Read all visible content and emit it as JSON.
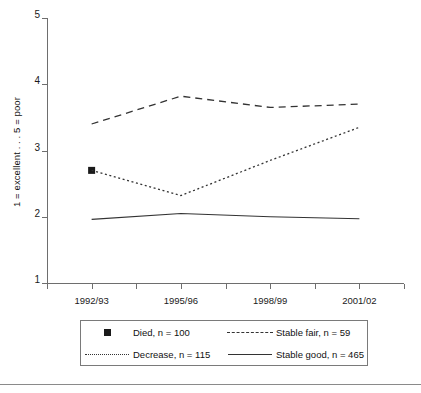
{
  "chart_data": {
    "type": "line",
    "title": "",
    "xlabel": "",
    "ylabel": "1 = excellent . . . 5 = poor",
    "categories": [
      "1992/93",
      "1995/96",
      "1998/99",
      "2001/02"
    ],
    "x_positions": [
      1,
      3,
      5,
      7
    ],
    "xlim": [
      0,
      8
    ],
    "ylim": [
      1,
      5
    ],
    "yticks": [
      "1",
      "2",
      "3",
      "4",
      "5"
    ],
    "ytick_values": [
      1,
      2,
      3,
      4,
      5
    ],
    "grid": false,
    "legend_position": "below",
    "series": [
      {
        "name": "Died, n = 100",
        "short_name": "Died",
        "n": 100,
        "style": "marker",
        "marker": "filled-square",
        "color": "#1a1a1a",
        "x": [
          1
        ],
        "values": [
          2.7
        ]
      },
      {
        "name": "Stable fair, n = 59",
        "short_name": "Stable fair",
        "n": 59,
        "style": "dashed",
        "color": "#333333",
        "x": [
          1,
          3,
          5,
          7
        ],
        "values": [
          3.4,
          3.82,
          3.65,
          3.7
        ]
      },
      {
        "name": "Decrease, n = 115",
        "short_name": "Decrease",
        "n": 115,
        "style": "dotted",
        "color": "#333333",
        "x": [
          1,
          3,
          5,
          7
        ],
        "values": [
          2.7,
          2.32,
          2.85,
          3.35
        ]
      },
      {
        "name": "Stable good, n = 465",
        "short_name": "Stable good",
        "n": 465,
        "style": "solid",
        "color": "#333333",
        "x": [
          1,
          3,
          5,
          7
        ],
        "values": [
          1.96,
          2.05,
          2.0,
          1.97
        ]
      }
    ]
  },
  "legend": {
    "rows": [
      [
        {
          "label": "Died, n = 100",
          "sample": "filled-square",
          "name": "died"
        },
        {
          "label": "Stable fair, n = 59",
          "sample": "dashed-line",
          "name": "stable-fair"
        }
      ],
      [
        {
          "label": "Decrease, n = 115",
          "sample": "dotted-line",
          "name": "decrease"
        },
        {
          "label": "Stable good, n = 465",
          "sample": "solid-line",
          "name": "stable-good"
        }
      ]
    ]
  },
  "axes": {
    "y_title": "1 = excellent . . . 5 = poor",
    "y_labels": [
      "5",
      "4",
      "3",
      "2",
      "1"
    ],
    "x_labels": [
      "1992/93",
      "1995/96",
      "1998/99",
      "2001/02"
    ]
  },
  "colors": {
    "axis": "#6e6e6e",
    "ink": "#1a1a1a",
    "line": "#333333",
    "legend_border": "#7a7a7a",
    "rule": "#8a8a8a"
  }
}
